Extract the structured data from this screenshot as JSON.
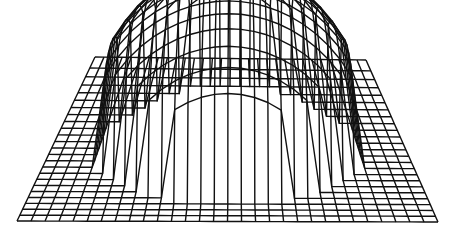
{
  "chart_data": {
    "type": "surface-wireframe",
    "title": "",
    "xlabel": "",
    "ylabel": "",
    "zlabel": "",
    "grid": {
      "nx": 30,
      "ny": 24
    },
    "base_corners": {
      "back_left": [
        95,
        57
      ],
      "back_right": [
        366,
        60
      ],
      "front_left": [
        17,
        221
      ],
      "front_right": [
        438,
        222
      ]
    },
    "dome": {
      "center_u": 0.5,
      "center_v": 0.5,
      "radius": 0.36,
      "height_px": 175,
      "shape": "hemisphere"
    },
    "line_color": "#111111",
    "background": "#ffffff"
  }
}
